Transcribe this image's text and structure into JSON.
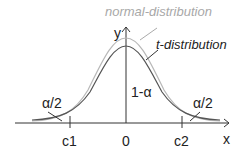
{
  "diagram": {
    "labels": {
      "normal": "normal-distribution",
      "t": "t-distribution",
      "y_axis": "y",
      "x_axis": "x",
      "center_area": "1-α",
      "left_tail": "α/2",
      "right_tail": "α/2",
      "c1": "c1",
      "zero": "0",
      "c2": "c2"
    },
    "colors": {
      "normal_curve": "#b8b8b8",
      "t_curve": "#555555",
      "axis": "#333333",
      "normal_label": "#a8a8a8",
      "text": "#222222"
    }
  }
}
